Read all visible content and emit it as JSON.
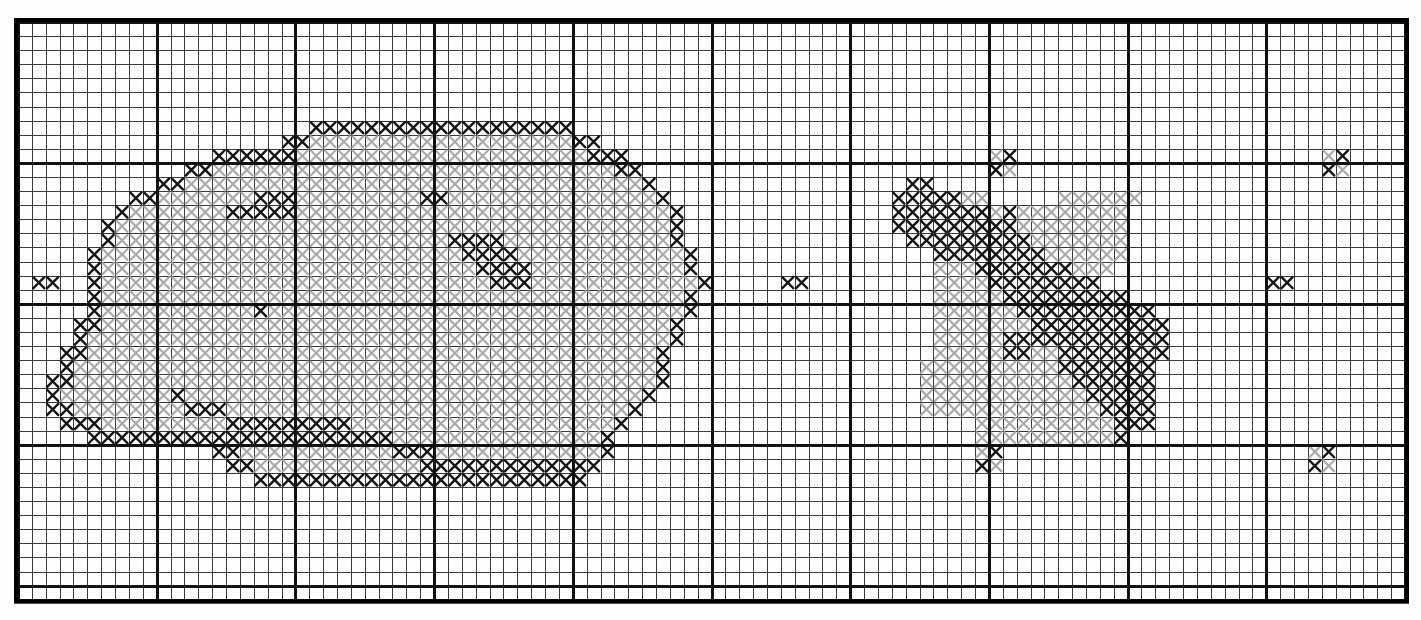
{
  "document": {
    "type": "cross-stitch-pattern-chart",
    "title": "Cross Stitch Pattern Chart",
    "description": "Counted cross-stitch chart on a square grid. Each occupied cell holds an X stitch symbol. Two symbol shades are used: solid black outline stitches and light grey fill stitches."
  },
  "grid": {
    "columns": 100,
    "rows": 41,
    "cell_width": 13.87,
    "cell_height": 14.09,
    "origin_x": 18,
    "origin_y": 22,
    "thin_line_color": "#3a3a3a",
    "thin_line_width": 1,
    "bold_line_color": "#111111",
    "bold_line_width": 3,
    "border_color": "#000000",
    "border_width": 4,
    "bold_every": 10,
    "background_color": "#ffffff"
  },
  "legend": {
    "symbols": [
      {
        "key": "K",
        "name": "black-cross-stitch",
        "color": "#141414",
        "stroke": 2.4,
        "label": "Dark outline stitch"
      },
      {
        "key": "G",
        "name": "grey-cross-stitch",
        "color": "#a9a9a9",
        "stroke": 2.1,
        "label": "Light fill stitch"
      }
    ]
  },
  "chart_data": {
    "type": "heatmap",
    "xlabel": "",
    "ylabel": "",
    "grid": true,
    "legend_position": "none",
    "categories": [
      "blank",
      "K",
      "G"
    ],
    "value_colors": {
      "blank": "#ffffff",
      "K": "#141414",
      "G": "#a9a9a9"
    },
    "cols": 100,
    "rows": 41,
    "note": "Rows are strings of 100 chars; '.'=empty, 'K'=black X, 'G'=grey X. Row 0 is the top row of the grid.",
    "rows_data": [
      "....................................................................................................",
      "....................................................................................................",
      "....................................................................................................",
      "....................................................................................................",
      "....................................................................................................",
      "....................................................................................................",
      "....................................................................................................",
      ".....................KKKKKKKKKKKKKKKKKKK............................................................",
      "...................KKGGGGGGGGGGGGGGGGGGGKK..........................................................",
      "..............KKKKKKGGGGGGGGGGGGGGGGGGGGGKKK..........................GK......................GK....",
      "............KKGGGGGGGGGGGGGGGGGGGGGGGGGGGGGKK.........................KG......................KG....",
      "..........KKGGGGGGGGGGGGGGGGGGGGGGGGGGGGGGGGGK..................KK..................................",
      "........KKGGGGGGGKKKGGGGGGGGGKKGGGGGGGGGGGGGGGK................KKKKKGG.....GGGGGG...................",
      ".......KGGGGGGGKKKKKGGGGGGGGGGGGGGGGGGGGGGGGGGGK...............KKKKKKKGKGGGGGGGG....................",
      "......KGGGGGGGGGGGGGGGGGGGGGGGGGGGGGGGGGGGGGGGGK...............KKKKKKKKKGGGGGGGG....................",
      "......KGGGGGGGGGGGGGGGGGGGGGGGGKKKKGGGGGGGGGGGGK................KKKKKKKKKGGGGGGG....................",
      ".....KGGGGGGGGGGGGGGGGGGGGGGGGGGKKKKGGGGGGGGGGGGK.................KKKKKKKKGGGGGG....................",
      ".....KGGGGGGGGGGGGGGGGGGGGGGGGGGGKKKKGGGGGGGGGGGK.................GGGKKKKKKKGGG.....................",
      ".KK..KGGGGGGGGGGGGGGGGGGGGGGGGGGGGKKKGGGGGGGGGGGGK.....KK.........GGGGKKKKKKKK............KK........",
      ".....KGGGGGGGGGGGGGGGGGGGGGGGGGGGGGGGGGGGGGGGGGGK.................GGGGGKKKKKKKKK...................",
      ".....KGGGGGGGGGGGKGGGGGGGGGGGGGGGGGGGGGGGGGGGGGGK.................GGGGGGKKKKKKKKKK.................",
      "....KKGGGGGGGGGGGGGGGGGGGGGGGGGGGGGGGGGGGGGGGGGK..................GGGGGGGKKKKKKKKKK................",
      "....KGGGGGGGGGGGGGGGGGGGGGGGGGGGGGGGGGGGGGGGGGGK..................GGGGGKKKKKKKKKKKK................",
      "...KKGGGGGGGGGGGGGGGGGGGGGGGGGGGGGGGGGGGGGGGGGK...................GGGGGKKGGKKKKKKKK................",
      "...KGGGGGGGGGGGGGGGGGGGGGGGGGGGGGGGGGGGGGGGGGGK..................GGGGGGGGGGKKKKKKK.................",
      "..KKGGGGGGGGGGGGGGGGGGGGGGGGGGGGGGGGGGGGGGGGGGK..................GGGGGGGGGGGKKKKKK.................",
      "..KGGGGGGGGKGGGGGGGGGGGGGGGGGGGGGGGGGGGGGGGGGK...................GGGGGGGGGGGGKKKKK.................",
      "..KKGGGGGGGGKKKGGGGGGGGGGGGGGGGGGGGGGGGGGGGGK....................GGGGGGGGGGGGGKKKK.................",
      "...KKKGGGGGGGGGKKKKKKKKKGGGGGGGGGGGGGGGGGGGK.........................GGGGGGGGGGKKK.................",
      ".....KKKKKKKKKKKKKKKKKKKKKKGGGGGGGGGGGGGGGK..........................GGGGGGGGGGK...................",
      "..............KKGGGGGGGGGGGKKKGGGGGGGGGGGGK..........................GK......................GK....",
      "...............KKGGGGGGGGGGGGKKKKKKKKKKKKK...........................KG......................KG....",
      ".................KKKKKKKKKKKKKKKKKKKKKKKK..........................................................",
      "....................................................................................................",
      "....................................................................................................",
      "....................................................................................................",
      "....................................................................................................",
      "....................................................................................................",
      "....................................................................................................",
      "....................................................................................................",
      "...................................................................................................."
    ]
  }
}
